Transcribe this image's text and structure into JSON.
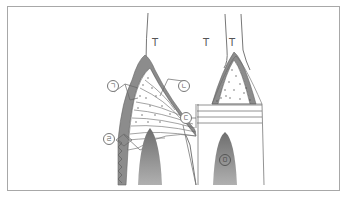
{
  "figure": {
    "type": "diagram",
    "labels": {
      "t_left": "T",
      "t_right_a": "T",
      "t_right_b": "T",
      "mark_a": "ㄱ",
      "mark_b": "ㄴ",
      "mark_c": "ㄷ",
      "mark_d": "ㄹ",
      "mark_e": "ㅁ"
    },
    "colors": {
      "frame": "#a8a8a8",
      "dark_fill": "#8c8c8c",
      "light_fill": "#bdbdbd",
      "line": "#666666"
    }
  }
}
